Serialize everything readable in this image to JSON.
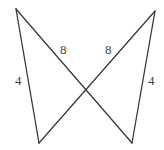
{
  "diagram": {
    "type": "geometry-figure",
    "stroke_color": "#3a3a3a",
    "label_color": "#444444",
    "vertices": {
      "top_left": [
        16,
        9
      ],
      "top_right": [
        155,
        11
      ],
      "bottom_left": [
        39,
        143
      ],
      "bottom_right": [
        132,
        143
      ]
    },
    "segments": [
      {
        "name": "left-side",
        "from": "top_left",
        "to": "bottom_left",
        "label": "4"
      },
      {
        "name": "left-diagonal",
        "from": "top_left",
        "to": "bottom_right",
        "label": "8"
      },
      {
        "name": "right-diagonal",
        "from": "top_right",
        "to": "bottom_left",
        "label": "8"
      },
      {
        "name": "right-side",
        "from": "top_right",
        "to": "bottom_right",
        "label": "4"
      }
    ],
    "labels": {
      "left_side": "4",
      "left_diagonal": "8",
      "right_diagonal": "8",
      "right_side": "4"
    }
  }
}
